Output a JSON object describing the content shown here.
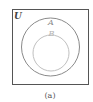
{
  "diagram": {
    "type": "venn",
    "caption": "(a)",
    "universe": {
      "label": "U",
      "stroke_color": "#555555"
    },
    "sets": [
      {
        "label": "A",
        "relation": "contains B",
        "stroke_color": "#8a8a8a",
        "label_color": "#8a8a8a"
      },
      {
        "label": "B",
        "relation": "subset of A",
        "stroke_color": "#c0c0c0",
        "label_color": "#b5b5b5"
      }
    ]
  }
}
